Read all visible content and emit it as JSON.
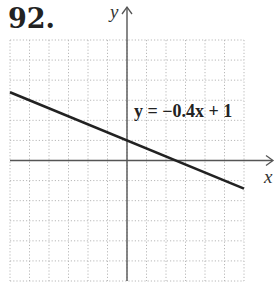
{
  "problem_number": "92.",
  "chart_data": {
    "type": "line",
    "title": "",
    "xlabel": "x",
    "ylabel": "y",
    "xlim": [
      -6,
      6
    ],
    "ylim": [
      -6,
      6
    ],
    "grid": true,
    "grid_step": 1,
    "tick_labels": false,
    "series": [
      {
        "name": "y = −0.4x + 1",
        "equation": "y = -0.4x + 1",
        "slope": -0.4,
        "intercept": 1,
        "x": [
          -6,
          0,
          2.5,
          6
        ],
        "y": [
          3.4,
          1,
          0,
          -1.4
        ]
      }
    ],
    "annotations": [
      {
        "text": "y = −0.4x + 1",
        "x": 0.3,
        "y": 2.4
      }
    ]
  },
  "labels": {
    "x_axis": "x",
    "y_axis": "y",
    "equation": "y = −0.4x + 1"
  },
  "colors": {
    "grid": "#b8b8b8",
    "axis": "#555555",
    "line": "#222222",
    "text": "#222222"
  }
}
